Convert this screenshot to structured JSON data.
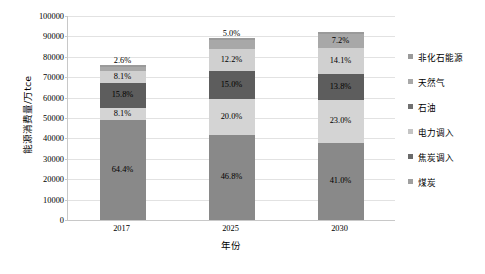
{
  "chart_data": {
    "type": "bar",
    "stacked": true,
    "title": "",
    "xlabel": "年份",
    "ylabel": "能源消费量/万tce",
    "ylim": [
      0,
      100000
    ],
    "ytick_step": 10000,
    "yticks": [
      "100000",
      "90000",
      "80000",
      "70000",
      "60000",
      "50000",
      "40000",
      "30000",
      "20000",
      "10000",
      "0"
    ],
    "grid": true,
    "legend_position": "right",
    "categories": [
      "2017",
      "2025",
      "2030"
    ],
    "totals": [
      76000,
      89000,
      92000
    ],
    "series": [
      {
        "name": "煤炭",
        "color": "#898989",
        "values": [
          64.4,
          46.8,
          41.0
        ],
        "labels": [
          "64.4%",
          "46.8%",
          "41.0%"
        ]
      },
      {
        "name": "焦炭调入",
        "color": "#d4d4d4",
        "values": [
          8.1,
          20.0,
          23.0
        ],
        "labels": [
          "8.1%",
          "20.0%",
          "23.0%"
        ]
      },
      {
        "name": "电力调入",
        "color": "#5d5d5d",
        "values": [
          15.8,
          15.0,
          13.8
        ],
        "labels": [
          "15.8%",
          "15.0%",
          "13.8%"
        ]
      },
      {
        "name": "石油",
        "color": "#d0d0d0",
        "values": [
          8.1,
          12.2,
          14.1
        ],
        "labels": [
          "8.1%",
          "12.2%",
          "14.1%"
        ]
      },
      {
        "name": "天然气",
        "color": "#a8a8a8",
        "values": [
          2.6,
          5.0,
          7.2
        ],
        "labels": [
          "2.6%",
          "5.0%",
          "7.2%"
        ]
      },
      {
        "name": "非化石能源",
        "color": "#9a9a9a",
        "values": [
          1.0,
          1.0,
          0.9
        ],
        "labels": [
          "",
          "",
          ""
        ]
      }
    ],
    "legend_entries": [
      {
        "label": "非化石能源",
        "color": "#9a9a9a"
      },
      {
        "label": "天然气",
        "color": "#a8a8a8"
      },
      {
        "label": "石油",
        "color": "#707070"
      },
      {
        "label": "电力调入",
        "color": "#c4c4c4"
      },
      {
        "label": "焦炭调入",
        "color": "#6a6a6a"
      },
      {
        "label": "煤炭",
        "color": "#9f9f9f"
      }
    ]
  }
}
